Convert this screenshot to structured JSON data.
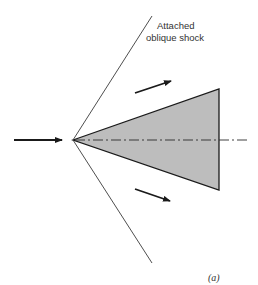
{
  "figure": {
    "label_line1": "Attached",
    "label_line2": "oblique shock",
    "panel_label": "(a)",
    "colors": {
      "line": "#1a1a1a",
      "shock": "#3a3a3a",
      "wedge_fill": "#bdbdbd",
      "text": "#333333"
    }
  },
  "elements": {
    "freestream_arrow": "incoming-flow-arrow",
    "upper_flow_arrow": "deflected-flow-arrow-upper",
    "lower_flow_arrow": "deflected-flow-arrow-lower",
    "wedge": "shaded-wedge",
    "centerline": "dash-dot-centerline",
    "upper_shock": "upper-oblique-shock-line",
    "lower_shock": "lower-oblique-shock-line"
  }
}
